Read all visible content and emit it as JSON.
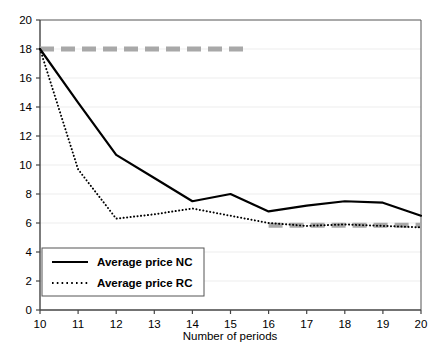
{
  "chart_data": {
    "type": "line",
    "title": "",
    "xlabel": "Number of periods",
    "ylabel": "",
    "x": [
      10,
      11,
      12,
      13,
      14,
      15,
      16,
      17,
      18,
      19,
      20
    ],
    "xlim": [
      10,
      20
    ],
    "ylim": [
      0,
      20
    ],
    "xticks": [
      "10",
      "11",
      "12",
      "13",
      "14",
      "15",
      "16",
      "17",
      "18",
      "19",
      "20"
    ],
    "yticks": [
      "0",
      "2",
      "4",
      "6",
      "8",
      "10",
      "12",
      "14",
      "16",
      "18",
      "20"
    ],
    "grid": true,
    "legend_position": "lower-left",
    "series": [
      {
        "name": "Average price NC",
        "style": "solid",
        "color": "#000000",
        "values": [
          18.0,
          14.3,
          10.7,
          9.1,
          7.5,
          8.0,
          6.8,
          7.2,
          7.5,
          7.4,
          6.5
        ]
      },
      {
        "name": "Average price RC",
        "style": "dotted",
        "color": "#000000",
        "values": [
          18.0,
          9.7,
          6.3,
          6.6,
          7.0,
          6.5,
          6.0,
          5.8,
          5.9,
          5.8,
          5.7
        ]
      }
    ],
    "annotations": [
      {
        "name": "gray-dashed-upper",
        "style": "dashed",
        "color": "#a8a8a8",
        "y": 18.0,
        "x_start": 10,
        "x_end": 15.4
      },
      {
        "name": "gray-dashed-lower",
        "style": "dashed",
        "color": "#a8a8a8",
        "y": 5.85,
        "x_start": 16.0,
        "x_end": 20.0
      }
    ]
  },
  "legend": {
    "items": [
      {
        "label": "Average price NC"
      },
      {
        "label": "Average price RC"
      }
    ]
  },
  "axes": {
    "x_title": "Number of periods"
  }
}
